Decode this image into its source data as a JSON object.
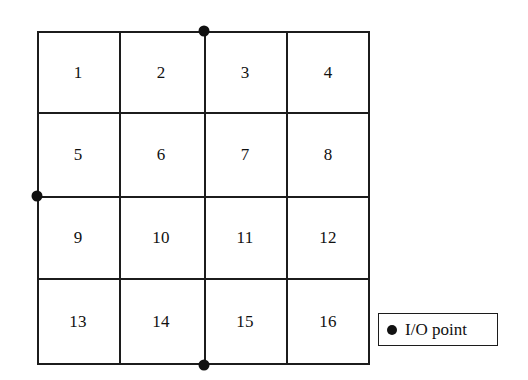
{
  "diagram": {
    "type": "grid-layout-with-io-points",
    "grid": {
      "rows": 4,
      "columns": 4,
      "cells": [
        {
          "label": "1",
          "row": 1,
          "col": 1
        },
        {
          "label": "2",
          "row": 1,
          "col": 2
        },
        {
          "label": "3",
          "row": 1,
          "col": 3
        },
        {
          "label": "4",
          "row": 1,
          "col": 4
        },
        {
          "label": "5",
          "row": 2,
          "col": 1
        },
        {
          "label": "6",
          "row": 2,
          "col": 2
        },
        {
          "label": "7",
          "row": 2,
          "col": 3
        },
        {
          "label": "8",
          "row": 2,
          "col": 4
        },
        {
          "label": "9",
          "row": 3,
          "col": 1
        },
        {
          "label": "10",
          "row": 3,
          "col": 2
        },
        {
          "label": "11",
          "row": 3,
          "col": 3
        },
        {
          "label": "12",
          "row": 3,
          "col": 4
        },
        {
          "label": "13",
          "row": 4,
          "col": 1
        },
        {
          "label": "14",
          "row": 4,
          "col": 2
        },
        {
          "label": "15",
          "row": 4,
          "col": 3
        },
        {
          "label": "16",
          "row": 4,
          "col": 4
        }
      ],
      "column_dividers_px": [
        82,
        167,
        249
      ],
      "row_dividers_px": [
        81,
        165,
        247
      ],
      "outer_px": {
        "left": 37,
        "top": 31,
        "width": 333,
        "height": 334
      }
    },
    "io_points": [
      {
        "name": "io-point-top",
        "edge": "top",
        "x_px": 167,
        "y_px": 0
      },
      {
        "name": "io-point-left",
        "edge": "left",
        "x_px": 0,
        "y_px": 165
      },
      {
        "name": "io-point-bottom",
        "edge": "bottom",
        "x_px": 167,
        "y_px": 334
      }
    ],
    "legend": {
      "marker": "filled-circle",
      "label": "I/O point"
    },
    "colors": {
      "line": "#1c1c1c",
      "dot": "#111111",
      "background": "#ffffff",
      "text": "#111111"
    }
  }
}
